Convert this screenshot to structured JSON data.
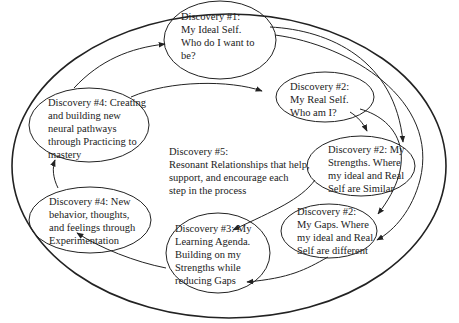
{
  "diagram": {
    "title": "",
    "nodes": [
      {
        "id": "d1",
        "text": "Discovery #1:\nMy Ideal Self.\nWho do I want to\nbe?"
      },
      {
        "id": "d2_real",
        "text": "Discovery #2:\nMy Real Self.\nWho am I?"
      },
      {
        "id": "d2_strengths",
        "text": "Discovery #2: My\nStrengths. Where\nmy ideal and Real\nSelf are Similar"
      },
      {
        "id": "d2_gaps",
        "text": "Discovery #2:\nMy Gaps. Where\nmy ideal and Real\nSelf are different"
      },
      {
        "id": "d3",
        "text": "Discovery #3: My\nLearning Agenda.\nBuilding on my\nStrengths while\nreducing Gaps"
      },
      {
        "id": "d4_new",
        "text": "Discovery #4: New\nbehavior, thoughts,\nand feelings through\nExperimentation"
      },
      {
        "id": "d4_creating",
        "text": "Discovery #4: Creating\nand building new\nneural pathways\nthrough Practicing to\nmastery"
      }
    ],
    "center": {
      "text": "Discovery #5:\nResonant Relationships that help,\nsupport, and encourage each\nstep in the process"
    },
    "edges": [
      {
        "from": "d4_creating",
        "to": "d1"
      },
      {
        "from": "d1",
        "to": "d2_real"
      },
      {
        "from": "d2_real",
        "to": "d2_strengths"
      },
      {
        "from": "d2_real",
        "to": "d2_gaps"
      },
      {
        "from": "d1",
        "to": "d2_strengths"
      },
      {
        "from": "d1",
        "to": "d2_gaps"
      },
      {
        "from": "d2_strengths",
        "to": "d3"
      },
      {
        "from": "d2_gaps",
        "to": "d3"
      },
      {
        "from": "d3",
        "to": "d4_new"
      },
      {
        "from": "d4_new",
        "to": "d4_creating"
      }
    ],
    "colors": {
      "line": "#222222",
      "background": "#ffffff"
    }
  }
}
